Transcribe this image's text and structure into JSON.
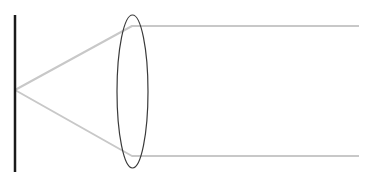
{
  "diagram": {
    "title": "",
    "width": 369,
    "height": 180,
    "colors": {
      "background": "#ffffff",
      "screen": "#1a1a1a",
      "rays": "#c8c8c8",
      "lens": "#3a3a3a"
    },
    "screen": {
      "x": 15,
      "y1": 15,
      "y2": 172,
      "stroke_width": 2.5
    },
    "source": {
      "x": 15,
      "y": 90
    },
    "lens": {
      "cx": 132.5,
      "cy": 91.5,
      "rx": 15.5,
      "ry": 76.5,
      "stroke_width": 1.2
    },
    "rays": [
      {
        "name": "upper-ray",
        "points": [
          [
            15,
            90
          ],
          [
            132,
            26
          ],
          [
            359,
            26
          ]
        ]
      },
      {
        "name": "lower-ray",
        "points": [
          [
            15,
            90
          ],
          [
            132,
            156
          ],
          [
            359,
            156
          ]
        ]
      }
    ],
    "labels": []
  }
}
